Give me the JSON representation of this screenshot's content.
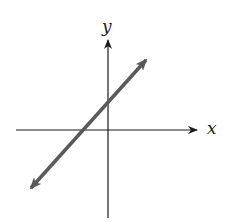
{
  "diagram": {
    "type": "coordinate-plane-line",
    "axes": {
      "x_label": "x",
      "y_label": "y",
      "color": "#1a1a1a"
    },
    "line": {
      "description": "straight line with positive slope, arrows on both ends, positive y-intercept, negative x-intercept",
      "color": "#5a5a5a",
      "arrows": "both-ends"
    }
  }
}
